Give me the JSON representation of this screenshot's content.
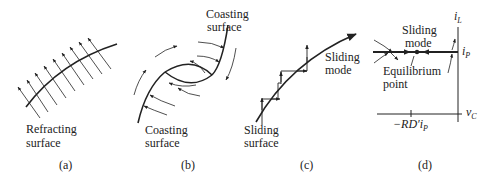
{
  "figure": {
    "panels": [
      {
        "id": "a",
        "caption": "(a)",
        "labels": {
          "surface_line1": "Refracting",
          "surface_line2": "surface"
        }
      },
      {
        "id": "b",
        "caption": "(b)",
        "labels": {
          "top_surface_line1": "Coasting",
          "top_surface_line2": "surface",
          "bottom_surface_line1": "Coasting",
          "bottom_surface_line2": "surface"
        }
      },
      {
        "id": "c",
        "caption": "(c)",
        "labels": {
          "mode_line1": "Sliding",
          "mode_line2": "mode",
          "surface_line1": "Sliding",
          "surface_line2": "surface"
        }
      },
      {
        "id": "d",
        "caption": "(d)",
        "labels": {
          "mode_line1": "Sliding",
          "mode_line2": "mode",
          "equilibrium_line1": "Equilibrium",
          "equilibrium_line2": "point",
          "y_axis": "i",
          "y_axis_sub": "L",
          "i_p": "i",
          "i_p_sub": "P",
          "x_axis": "v",
          "x_axis_sub": "C",
          "x_tick": "−RD′i",
          "x_tick_sub": "P"
        }
      }
    ],
    "colors": {
      "ink": "#222222",
      "background": "#ffffff"
    }
  }
}
